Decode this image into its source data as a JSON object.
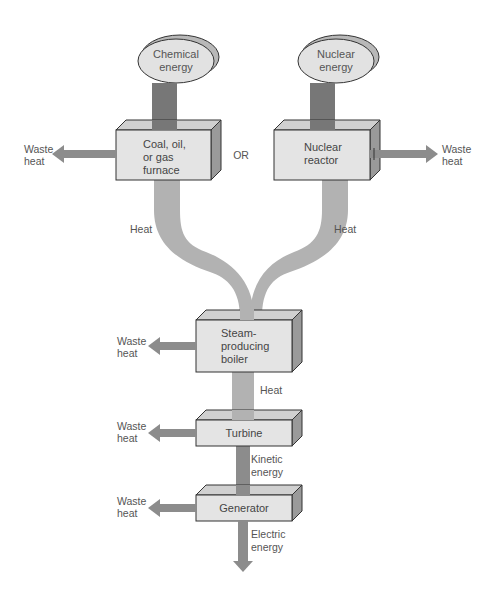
{
  "colors": {
    "box_face": "#e4e4e4",
    "box_top": "#d0d0d0",
    "box_side": "#9a9a9a",
    "oval_fill": "#e2e2e2",
    "oval_shadow": "#b8b8b8",
    "input_bar": "#777777",
    "heat_flow": "#b2b2b2",
    "waste_arrow": "#8c8c8c",
    "text": "#555555"
  },
  "sources": {
    "chemical": {
      "line1": "Chemical",
      "line2": "energy"
    },
    "nuclear": {
      "line1": "Nuclear",
      "line2": "energy"
    }
  },
  "boxes": {
    "furnace": {
      "line1": "Coal, oil,",
      "line2": "or gas",
      "line3": "furnace"
    },
    "reactor": {
      "line1": "Nuclear",
      "line2": "reactor"
    },
    "boiler": {
      "line1": "Steam-",
      "line2": "producing",
      "line3": "boiler"
    },
    "turbine": {
      "label": "Turbine"
    },
    "generator": {
      "label": "Generator"
    }
  },
  "or_label": "OR",
  "flows": {
    "heat_left": "Heat",
    "heat_right": "Heat",
    "heat_boiler": "Heat",
    "kinetic": {
      "line1": "Kinetic",
      "line2": "energy"
    },
    "electric": {
      "line1": "Electric",
      "line2": "energy"
    }
  },
  "waste": {
    "furnace": {
      "line1": "Waste",
      "line2": "heat"
    },
    "reactor": {
      "line1": "Waste",
      "line2": "heat"
    },
    "boiler": {
      "line1": "Waste",
      "line2": "heat"
    },
    "turbine": {
      "line1": "Waste",
      "line2": "heat"
    },
    "generator": {
      "line1": "Waste",
      "line2": "heat"
    }
  }
}
